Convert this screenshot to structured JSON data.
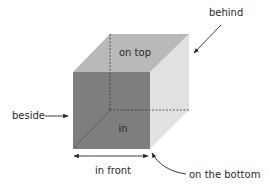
{
  "diagram": {
    "colors": {
      "top_face": "#b9b9b9",
      "front_face": "#7e7e7e",
      "side_face": "#e1e1e1",
      "hidden_edges": "#3a3a3a",
      "arrows": "#2a2a2a",
      "text": "#2a2a2a"
    },
    "labels": {
      "on_top": "on top",
      "in": "in",
      "beside": "beside",
      "behind": "behind",
      "in_front": "in front",
      "on_the_bottom": "on the bottom"
    }
  }
}
